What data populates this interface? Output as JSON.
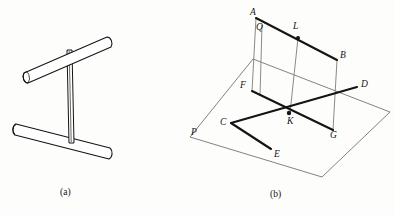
{
  "figure": {
    "background_color": "#fdfdfc",
    "ink_color": "#141414",
    "thin_line_color": "#5a5a5a",
    "panels": [
      {
        "id": "a",
        "caption": "(a)",
        "caption_x": 88,
        "caption_y": 190
      },
      {
        "id": "b",
        "caption": "(b)",
        "caption_x": 272,
        "caption_y": 192
      }
    ]
  },
  "panel_a": {
    "description": "Two thick rods joined by a thin vertical post",
    "parts": [
      {
        "name": "upper-rod",
        "label": "upper rod"
      },
      {
        "name": "lower-rod",
        "label": "lower rod"
      },
      {
        "name": "vertical-post",
        "label": "vertical post"
      }
    ]
  },
  "panel_b": {
    "description": "Line and plane geometry diagram",
    "plane_label": "P",
    "vertex_labels": [
      {
        "id": "A",
        "text": "A",
        "x": 250,
        "y": 12
      },
      {
        "id": "Q",
        "text": "Q",
        "x": 255,
        "y": 26
      },
      {
        "id": "L",
        "text": "L",
        "x": 293,
        "y": 25
      },
      {
        "id": "B",
        "text": "B",
        "x": 339,
        "y": 52
      },
      {
        "id": "F",
        "text": "F",
        "x": 241,
        "y": 84
      },
      {
        "id": "D",
        "text": "D",
        "x": 360,
        "y": 83
      },
      {
        "id": "K",
        "text": "K",
        "x": 292,
        "y": 121
      },
      {
        "id": "C",
        "text": "C",
        "x": 224,
        "y": 124
      },
      {
        "id": "G",
        "text": "G",
        "x": 331,
        "y": 135
      },
      {
        "id": "E",
        "text": "E",
        "x": 273,
        "y": 155
      },
      {
        "id": "P",
        "text": "P",
        "x": 191,
        "y": 131
      }
    ],
    "segments": [
      {
        "name": "segment-A-B",
        "from": "A",
        "to": "B",
        "weight": "thick"
      },
      {
        "name": "segment-F-G",
        "from": "F",
        "to": "G",
        "weight": "thick"
      },
      {
        "name": "segment-A-F",
        "from": "A",
        "to": "F",
        "weight": "thin"
      },
      {
        "name": "segment-B-G",
        "from": "B",
        "to": "G",
        "weight": "thin"
      },
      {
        "name": "segment-Q-K",
        "from": "Q",
        "to": "K",
        "weight": "thin"
      },
      {
        "name": "segment-L-K",
        "from": "L",
        "to": "K",
        "weight": "thin"
      },
      {
        "name": "segment-C-D",
        "from": "C",
        "to": "D",
        "weight": "thick"
      },
      {
        "name": "segment-C-E",
        "from": "C",
        "to": "E",
        "weight": "thick"
      },
      {
        "name": "plane-outline-P",
        "from": "P",
        "to": "P",
        "weight": "thin"
      }
    ],
    "marked_points": [
      {
        "id": "K",
        "x": 289,
        "y": 113
      },
      {
        "id": "L",
        "x": 298,
        "y": 38
      }
    ]
  }
}
